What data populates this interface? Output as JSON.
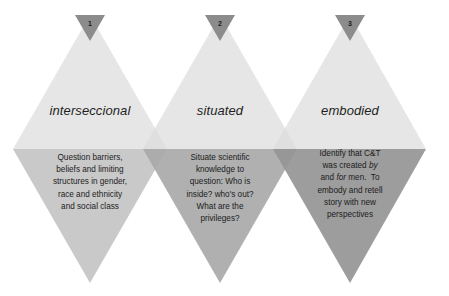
{
  "diagram": {
    "type": "three-diamond-concept-diagram",
    "colors": {
      "upper_half": "#e2e2e2",
      "badge": "#8c8c8c",
      "lower_half_1": "#cbcbcb",
      "lower_half_2": "#b1b1b1",
      "lower_half_3": "#9b9b9b",
      "text": "#1c1c1c"
    },
    "items": [
      {
        "number": "1",
        "title": "interseccional",
        "description_lines": [
          "Question barriers,",
          "beliefs and limiting",
          "structures in gender,",
          "race and ethnicity",
          "and social class"
        ]
      },
      {
        "number": "2",
        "title": "situated",
        "description_lines": [
          "Situate scientific",
          "knowledge to",
          "question: Who is",
          "inside? who's out?",
          "What are the",
          "privileges?"
        ]
      },
      {
        "number": "3",
        "title": "embodied",
        "description_lines": [
          "Identify that C&T",
          "was created |by|",
          "and |for| men.  To",
          "embody and retell",
          "story with new",
          "perspectives"
        ],
        "description_parts": {
          "line1": "Identify that C&T",
          "line2_pre": "was created ",
          "line2_em": "by",
          "line3_pre": "and ",
          "line3_em": "for",
          "line3_post": " men.  To",
          "line4": "embody and retell",
          "line5": "story with new",
          "line6": "perspectives"
        }
      }
    ]
  }
}
